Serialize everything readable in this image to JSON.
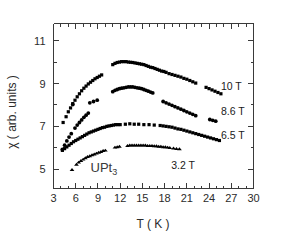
{
  "chart_data": {
    "type": "scatter",
    "title": "",
    "xlabel": "T ( K )",
    "ylabel": "χ ( arb. units )",
    "xlim": [
      3,
      30
    ],
    "ylim": [
      4.1,
      11.8
    ],
    "xticks": [
      3,
      6,
      9,
      12,
      15,
      18,
      21,
      24,
      27,
      30
    ],
    "yticks": [
      5,
      7,
      9,
      11
    ],
    "xminor_per_major": 3,
    "yminor_per_major": 2,
    "grid": false,
    "legend_position": "inline-right",
    "annotations": [
      {
        "text": "UPt",
        "subscript": "3",
        "x": 9.8,
        "y": 4.85
      }
    ],
    "series": [
      {
        "name": "10 T",
        "label": "10 T",
        "marker": "square",
        "color": "#000000",
        "label_x": 25.6,
        "label_y": 8.88,
        "points": [
          [
            4.3,
            7.18
          ],
          [
            4.7,
            7.45
          ],
          [
            5.0,
            7.68
          ],
          [
            5.3,
            7.86
          ],
          [
            5.6,
            8.06
          ],
          [
            5.9,
            8.22
          ],
          [
            6.2,
            8.38
          ],
          [
            6.5,
            8.52
          ],
          [
            6.8,
            8.66
          ],
          [
            7.1,
            8.78
          ],
          [
            7.4,
            8.88
          ],
          [
            7.7,
            8.98
          ],
          [
            8.0,
            9.06
          ],
          [
            8.3,
            9.14
          ],
          [
            8.6,
            9.22
          ],
          [
            8.9,
            9.28
          ],
          [
            9.2,
            9.34
          ],
          [
            9.5,
            9.4
          ],
          [
            11.0,
            9.88
          ],
          [
            11.3,
            9.94
          ],
          [
            11.6,
            9.98
          ],
          [
            11.9,
            10.0
          ],
          [
            12.2,
            10.02
          ],
          [
            12.5,
            10.02
          ],
          [
            12.8,
            10.02
          ],
          [
            13.1,
            10.0
          ],
          [
            13.4,
            9.99
          ],
          [
            13.7,
            9.98
          ],
          [
            14.0,
            9.96
          ],
          [
            14.3,
            9.94
          ],
          [
            14.6,
            9.92
          ],
          [
            14.9,
            9.9
          ],
          [
            15.2,
            9.88
          ],
          [
            15.5,
            9.84
          ],
          [
            15.8,
            9.8
          ],
          [
            16.1,
            9.76
          ],
          [
            16.4,
            9.74
          ],
          [
            16.7,
            9.7
          ],
          [
            17.0,
            9.66
          ],
          [
            17.3,
            9.62
          ],
          [
            17.6,
            9.58
          ],
          [
            17.9,
            9.56
          ],
          [
            18.2,
            9.52
          ],
          [
            18.6,
            9.46
          ],
          [
            19.0,
            9.42
          ],
          [
            19.4,
            9.38
          ],
          [
            19.8,
            9.34
          ],
          [
            20.2,
            9.3
          ],
          [
            20.6,
            9.24
          ],
          [
            21.0,
            9.2
          ],
          [
            21.4,
            9.14
          ],
          [
            21.8,
            9.08
          ],
          [
            22.2,
            9.02
          ],
          [
            23.6,
            8.82
          ],
          [
            24.0,
            8.76
          ],
          [
            24.4,
            8.7
          ],
          [
            24.8,
            8.64
          ],
          [
            25.2,
            8.58
          ],
          [
            25.6,
            8.52
          ]
        ]
      },
      {
        "name": "8.6 T",
        "label": "8.6 T",
        "marker": "circle",
        "color": "#000000",
        "label_x": 25.6,
        "label_y": 7.7,
        "points": [
          [
            4.2,
            5.92
          ],
          [
            4.5,
            6.12
          ],
          [
            4.8,
            6.32
          ],
          [
            5.1,
            6.5
          ],
          [
            5.4,
            6.66
          ],
          [
            5.6,
            8.02
          ],
          [
            5.9,
            6.92
          ],
          [
            6.2,
            7.06
          ],
          [
            6.5,
            7.18
          ],
          [
            6.8,
            7.3
          ],
          [
            7.1,
            7.42
          ],
          [
            7.4,
            7.52
          ],
          [
            7.7,
            7.62
          ],
          [
            7.9,
            8.1
          ],
          [
            8.4,
            8.16
          ],
          [
            8.9,
            8.22
          ],
          [
            11.0,
            8.62
          ],
          [
            11.3,
            8.68
          ],
          [
            11.6,
            8.72
          ],
          [
            11.9,
            8.76
          ],
          [
            12.2,
            8.78
          ],
          [
            12.5,
            8.8
          ],
          [
            12.8,
            8.82
          ],
          [
            13.1,
            8.84
          ],
          [
            13.4,
            8.84
          ],
          [
            13.7,
            8.84
          ],
          [
            14.0,
            8.82
          ],
          [
            14.3,
            8.8
          ],
          [
            14.6,
            8.78
          ],
          [
            14.9,
            8.76
          ],
          [
            15.2,
            8.72
          ],
          [
            15.5,
            8.68
          ],
          [
            15.8,
            8.64
          ],
          [
            16.1,
            8.6
          ],
          [
            16.4,
            8.56
          ],
          [
            17.8,
            8.16
          ],
          [
            18.2,
            8.1
          ],
          [
            18.6,
            8.04
          ],
          [
            19.0,
            7.98
          ],
          [
            19.4,
            7.92
          ],
          [
            19.8,
            7.86
          ],
          [
            20.2,
            7.8
          ],
          [
            20.6,
            7.74
          ],
          [
            21.0,
            7.68
          ],
          [
            21.4,
            7.62
          ],
          [
            21.8,
            7.56
          ],
          [
            22.2,
            7.5
          ],
          [
            24.1,
            7.32
          ],
          [
            24.5,
            7.28
          ],
          [
            24.9,
            7.24
          ]
        ]
      },
      {
        "name": "6.5 T",
        "label": "6.5 T",
        "marker": "square",
        "color": "#000000",
        "label_x": 25.6,
        "label_y": 6.62,
        "points": [
          [
            4.2,
            5.88
          ],
          [
            4.5,
            5.96
          ],
          [
            4.8,
            6.04
          ],
          [
            5.1,
            6.12
          ],
          [
            5.4,
            6.2
          ],
          [
            5.7,
            6.28
          ],
          [
            6.0,
            6.34
          ],
          [
            6.3,
            6.4
          ],
          [
            6.6,
            6.46
          ],
          [
            6.9,
            6.52
          ],
          [
            7.2,
            6.58
          ],
          [
            7.5,
            6.64
          ],
          [
            7.8,
            6.7
          ],
          [
            8.1,
            6.74
          ],
          [
            8.4,
            6.78
          ],
          [
            8.7,
            6.82
          ],
          [
            9.0,
            6.86
          ],
          [
            9.3,
            6.9
          ],
          [
            9.6,
            6.94
          ],
          [
            9.9,
            6.96
          ],
          [
            10.2,
            7.0
          ],
          [
            10.5,
            7.02
          ],
          [
            10.8,
            7.04
          ],
          [
            11.1,
            7.06
          ],
          [
            11.4,
            7.08
          ],
          [
            11.7,
            7.08
          ],
          [
            12.0,
            7.08
          ],
          [
            12.7,
            7.1
          ],
          [
            13.3,
            7.12
          ],
          [
            13.9,
            7.1
          ],
          [
            14.5,
            7.1
          ],
          [
            15.2,
            7.08
          ],
          [
            15.9,
            7.08
          ],
          [
            16.6,
            7.06
          ],
          [
            17.4,
            7.04
          ],
          [
            17.8,
            7.02
          ],
          [
            18.2,
            7.0
          ],
          [
            18.6,
            6.98
          ],
          [
            19.0,
            6.96
          ],
          [
            19.4,
            6.92
          ],
          [
            19.8,
            6.88
          ],
          [
            20.2,
            6.86
          ],
          [
            20.6,
            6.82
          ],
          [
            21.0,
            6.78
          ],
          [
            21.4,
            6.74
          ],
          [
            21.8,
            6.7
          ],
          [
            22.2,
            6.66
          ],
          [
            22.6,
            6.62
          ],
          [
            23.0,
            6.58
          ],
          [
            23.4,
            6.54
          ],
          [
            23.8,
            6.5
          ],
          [
            24.2,
            6.46
          ],
          [
            24.6,
            6.42
          ],
          [
            25.0,
            6.38
          ],
          [
            25.4,
            6.34
          ]
        ]
      },
      {
        "name": "3.2 T",
        "label": "3.2 T",
        "marker": "triangle",
        "color": "#000000",
        "label_x": 18.9,
        "label_y": 5.22,
        "points": [
          [
            5.5,
            4.98
          ],
          [
            6.1,
            5.22
          ],
          [
            6.4,
            5.32
          ],
          [
            6.7,
            5.4
          ],
          [
            7.0,
            5.46
          ],
          [
            7.3,
            5.52
          ],
          [
            7.6,
            5.58
          ],
          [
            7.9,
            5.62
          ],
          [
            8.2,
            5.66
          ],
          [
            8.5,
            5.7
          ],
          [
            8.8,
            5.74
          ],
          [
            9.1,
            5.78
          ],
          [
            9.4,
            5.82
          ],
          [
            9.7,
            5.86
          ],
          [
            10.0,
            5.88
          ],
          [
            11.3,
            6.02
          ],
          [
            11.6,
            6.04
          ],
          [
            11.9,
            6.06
          ],
          [
            13.0,
            6.1
          ],
          [
            13.3,
            6.12
          ],
          [
            13.6,
            6.12
          ],
          [
            13.9,
            6.12
          ],
          [
            14.2,
            6.12
          ],
          [
            14.5,
            6.12
          ],
          [
            14.8,
            6.12
          ],
          [
            15.1,
            6.12
          ],
          [
            15.4,
            6.12
          ],
          [
            15.7,
            6.1
          ],
          [
            16.0,
            6.1
          ],
          [
            16.3,
            6.1
          ],
          [
            16.6,
            6.08
          ],
          [
            16.9,
            6.08
          ],
          [
            17.2,
            6.06
          ],
          [
            17.5,
            6.06
          ],
          [
            17.8,
            6.04
          ],
          [
            18.1,
            6.04
          ],
          [
            18.4,
            6.02
          ],
          [
            18.7,
            6.0
          ],
          [
            19.2,
            5.98
          ],
          [
            19.6,
            5.96
          ],
          [
            20.0,
            5.94
          ]
        ]
      }
    ]
  }
}
